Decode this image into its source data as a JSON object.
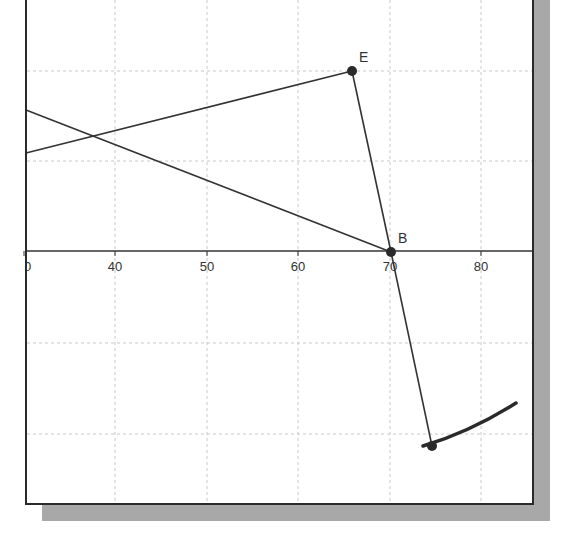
{
  "view": {
    "background": "#ffffff",
    "frame_color": "#2a2a2a",
    "shadow_color": "#a8a8a8",
    "grid_color": "#c8c8c8",
    "line_color": "#333333"
  },
  "axis": {
    "x_ticks": [
      {
        "label": "30",
        "px": 24
      },
      {
        "label": "40",
        "px": 115
      },
      {
        "label": "50",
        "px": 207
      },
      {
        "label": "60",
        "px": 298
      },
      {
        "label": "70",
        "px": 390
      },
      {
        "label": "80",
        "px": 481
      }
    ],
    "x_axis_y_px": 251,
    "h_grid_px": [
      71,
      161,
      343,
      434
    ],
    "v_grid_px": [
      115,
      207,
      298,
      390,
      481
    ]
  },
  "points": {
    "E": {
      "label": "E",
      "x": 352,
      "y": 71
    },
    "B": {
      "label": "B",
      "x": 391,
      "y": 252
    },
    "C": {
      "label": "",
      "x": 432,
      "y": 446
    }
  },
  "segments": [
    {
      "name": "line-left-to-B",
      "x1": 26,
      "y1": 110,
      "x2": 391,
      "y2": 252
    },
    {
      "name": "line-left-to-E",
      "x1": 26,
      "y1": 153,
      "x2": 352,
      "y2": 71
    },
    {
      "name": "segment-E-B",
      "x1": 352,
      "y1": 71,
      "x2": 391,
      "y2": 252
    },
    {
      "name": "segment-B-C",
      "x1": 391,
      "y1": 252,
      "x2": 432,
      "y2": 446
    }
  ],
  "arc": {
    "name": "trace-arc",
    "path": "M 423 446 Q 470 432 516 403"
  }
}
